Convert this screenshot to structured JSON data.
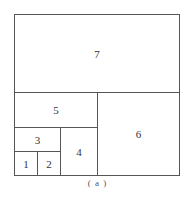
{
  "diagram": {
    "caption": "( a )",
    "border_color": "#555555",
    "cells": [
      {
        "id": "7",
        "label": "7",
        "x": 14,
        "y": 14,
        "w": 166,
        "h": 79
      },
      {
        "id": "5",
        "label": "5",
        "x": 14,
        "y": 92,
        "w": 84,
        "h": 36
      },
      {
        "id": "6",
        "label": "6",
        "x": 97,
        "y": 92,
        "w": 83,
        "h": 84
      },
      {
        "id": "3",
        "label": "3",
        "x": 14,
        "y": 127,
        "w": 47,
        "h": 25
      },
      {
        "id": "4",
        "label": "4",
        "x": 60,
        "y": 127,
        "w": 38,
        "h": 49
      },
      {
        "id": "1",
        "label": "1",
        "x": 14,
        "y": 151,
        "w": 24,
        "h": 25
      },
      {
        "id": "2",
        "label": "2",
        "x": 37,
        "y": 151,
        "w": 24,
        "h": 25
      }
    ]
  }
}
